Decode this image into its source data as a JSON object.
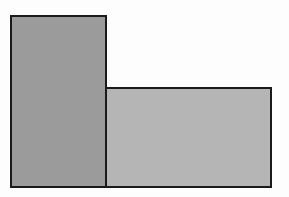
{
  "diagram": {
    "canvas": {
      "width": 289,
      "height": 197,
      "background": "#fdfdfd"
    },
    "shapes": [
      {
        "id": "rect-left",
        "type": "rectangle",
        "fill": "#9b9b9b",
        "stroke": "#1a1a1a",
        "stroke_width": 2,
        "x": 10,
        "y": 15,
        "width": 97,
        "height": 173
      },
      {
        "id": "rect-right",
        "type": "rectangle",
        "fill": "#b5b5b5",
        "stroke": "#1a1a1a",
        "stroke_width": 2,
        "x": 105,
        "y": 87,
        "width": 167,
        "height": 101
      }
    ]
  }
}
